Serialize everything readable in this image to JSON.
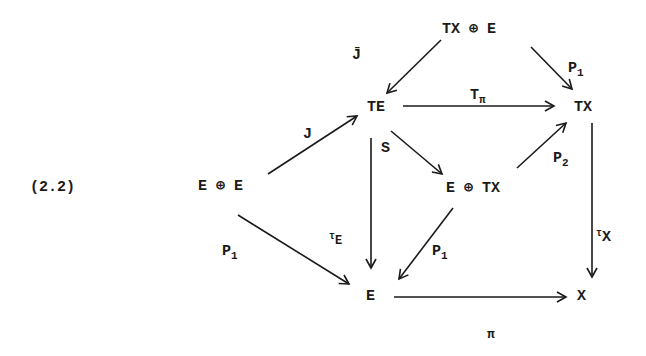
{
  "equation_number": "(2.2)",
  "nodes": {
    "tx_plus_e": "TX ⊕ E",
    "te": "TE",
    "tx_top": "TX",
    "e_plus_e": "E ⊕ E",
    "e_plus_tx": "E ⊕ TX",
    "e_bottom": "E",
    "x": "X"
  },
  "arrows": {
    "jbar": {
      "label": "J̄",
      "from": "TX ⊕ E",
      "to": "TE"
    },
    "p1_top": {
      "label": "P",
      "sub": "1",
      "from": "TX ⊕ E",
      "to": "TX"
    },
    "t_pi": {
      "label": "T",
      "sub": "π",
      "from": "TE",
      "to": "TX"
    },
    "j": {
      "label": "J",
      "from": "E ⊕ E",
      "to": "TE"
    },
    "s": {
      "label": "S",
      "from": "TE",
      "to": "E ⊕ TX"
    },
    "p2": {
      "label": "P",
      "sub": "2",
      "from": "E ⊕ TX",
      "to": "TX"
    },
    "tau_e": {
      "label": "E",
      "pre": "τ",
      "from": "TE",
      "to": "E"
    },
    "p1_mid": {
      "label": "P",
      "sub": "1",
      "from": "E ⊕ TX",
      "to": "E"
    },
    "p1_left": {
      "label": "P",
      "sub": "1",
      "from": "E ⊕ E",
      "to": "E"
    },
    "tau_x": {
      "label": "X",
      "pre": "τ",
      "from": "TX",
      "to": "X"
    },
    "pi": {
      "label": "π",
      "from": "E",
      "to": "X"
    }
  }
}
